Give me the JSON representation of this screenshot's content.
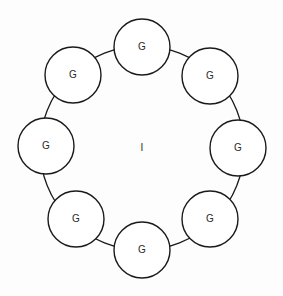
{
  "diagram": {
    "type": "ring",
    "center": {
      "label": "I",
      "x": 142,
      "y": 148
    },
    "ring": {
      "cx": 142,
      "cy": 148,
      "r": 102,
      "stroke": "#1a1a1a"
    },
    "nodes": [
      {
        "label": "G",
        "cx": 142,
        "cy": 47,
        "r": 28
      },
      {
        "label": "G",
        "cx": 210,
        "cy": 76,
        "r": 28
      },
      {
        "label": "G",
        "cx": 238,
        "cy": 148,
        "r": 28
      },
      {
        "label": "G",
        "cx": 210,
        "cy": 219,
        "r": 28
      },
      {
        "label": "G",
        "cx": 142,
        "cy": 250,
        "r": 28
      },
      {
        "label": "G",
        "cx": 76,
        "cy": 219,
        "r": 28
      },
      {
        "label": "G",
        "cx": 46,
        "cy": 146,
        "r": 28
      },
      {
        "label": "G",
        "cx": 73,
        "cy": 75,
        "r": 28
      }
    ]
  }
}
